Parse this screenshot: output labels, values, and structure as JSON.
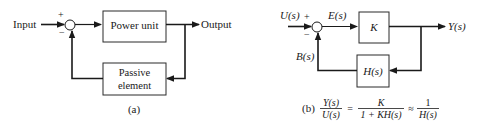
{
  "diagram_a": {
    "input_label": "Input",
    "output_label": "Output",
    "plus_sign": "+",
    "minus_sign": "−",
    "forward_block": "Power unit",
    "feedback_block_line1": "Passive",
    "feedback_block_line2": "element",
    "caption": "(a)"
  },
  "diagram_b": {
    "input_label": "U(s)",
    "error_label": "E(s)",
    "output_label": "Y(s)",
    "feedback_signal_label": "B(s)",
    "plus_sign": "+",
    "minus_sign": "−",
    "forward_block": "K",
    "feedback_block": "H(s)",
    "caption": "(b)",
    "formula": {
      "lhs_num": "Y(s)",
      "lhs_den": "U(s)",
      "eq1": "=",
      "mid_num": "K",
      "mid_den": "1 + KH(s)",
      "approx": "≈",
      "rhs_num": "1",
      "rhs_den": "H(s)"
    }
  }
}
